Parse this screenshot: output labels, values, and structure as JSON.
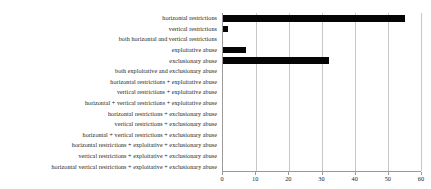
{
  "chart_data": {
    "type": "bar",
    "orientation": "horizontal",
    "title": "",
    "subtitle": "",
    "xlabel": "",
    "ylabel": "",
    "xlim": [
      0,
      60
    ],
    "xticks": [
      0,
      10,
      20,
      30,
      40,
      50,
      60
    ],
    "grid": true,
    "grid_axis": "x",
    "legend": false,
    "legend_position": "none",
    "bar_color": "#050505",
    "axis_color": "#9a9a9a",
    "gridline_color": "#c8c8c8",
    "categories": [
      "horizontal restrictions",
      "vertical restrictions",
      "both horizontal and vertical restrictions",
      "exploitative abuse",
      "exclusionary abuse",
      "both exploitative and exclusionary abuse",
      "horizontal restrictions  + exploitative abuse",
      "vertical restrictions + exploitative abuse",
      "horizontal + vertical restrictions + exploitative abuse",
      "horizontal restrictions + exclusionary abuse",
      "vertical restrictions + exclusionary abuse",
      "horizontal  +  vertical restrictions + exclusionary abuse",
      "horizontal restrictions + exploitative + exclusionary abuse",
      "vertical restrictions + exploitative + exclusionary abuse",
      "horizontal vertical restrictions + exploitative + exclusionary abuse"
    ],
    "values": [
      55,
      1.5,
      0,
      7,
      32,
      0,
      0,
      0,
      0,
      0,
      0,
      0,
      0,
      0,
      0
    ]
  }
}
